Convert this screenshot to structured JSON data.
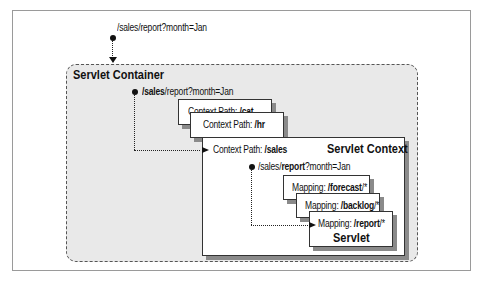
{
  "request": {
    "url": "/sales/report?month=Jan"
  },
  "servlet_container": {
    "title": "Servlet Container",
    "request_bold": "/sales",
    "request_rest": "/report?month=Jan",
    "contexts": [
      {
        "prefix": "Context Path: ",
        "path": "/cat"
      },
      {
        "prefix": "Context Path: ",
        "path": "/hr"
      },
      {
        "prefix": "Context Path: ",
        "path": "/sales"
      }
    ]
  },
  "servlet_context": {
    "title": "Servlet Context",
    "request_pre": "/sales/",
    "request_bold": "report",
    "request_post": "?month=Jan",
    "mappings": [
      {
        "prefix": "Mapping: ",
        "path": "/forecast",
        "suffix": "/*"
      },
      {
        "prefix": "Mapping: ",
        "path": "/backlog",
        "suffix": "/*"
      },
      {
        "prefix": "Mapping: ",
        "path": "/report",
        "suffix": "/*"
      }
    ],
    "servlet_label": "Servlet"
  }
}
